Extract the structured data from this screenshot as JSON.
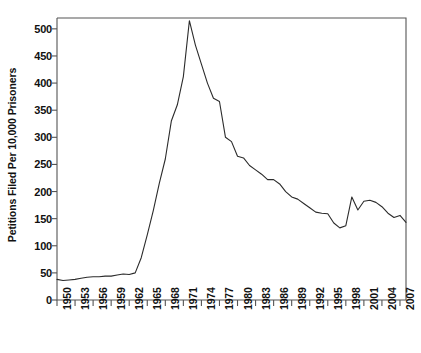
{
  "chart_data": {
    "type": "line",
    "title": "",
    "xlabel": "",
    "ylabel": "Petitions Filed Per 10,000 Prisoners",
    "xlim": [
      1950,
      2008
    ],
    "ylim": [
      0,
      520
    ],
    "grid": false,
    "legend": "none",
    "line_color": "#2b2b2b",
    "axis_color": "#555555",
    "ytick_values": [
      0,
      50,
      100,
      150,
      200,
      250,
      300,
      350,
      400,
      450,
      500
    ],
    "ytick_labels": [
      "0",
      "50",
      "100",
      "150",
      "200",
      "250",
      "300",
      "350",
      "400",
      "450",
      "500"
    ],
    "xtick_values": [
      1950,
      1953,
      1956,
      1959,
      1962,
      1965,
      1968,
      1971,
      1974,
      1977,
      1980,
      1983,
      1986,
      1989,
      1992,
      1995,
      1998,
      2001,
      2004,
      2007
    ],
    "xtick_labels": [
      "1950",
      "1953",
      "1956",
      "1959",
      "1962",
      "1965",
      "1968",
      "1971",
      "1974",
      "1977",
      "1980",
      "1983",
      "1986",
      "1989",
      "1992",
      "1995",
      "1998",
      "2001",
      "2004",
      "2007"
    ],
    "x": [
      1950,
      1951,
      1952,
      1953,
      1954,
      1955,
      1956,
      1957,
      1958,
      1959,
      1960,
      1961,
      1962,
      1963,
      1964,
      1965,
      1966,
      1967,
      1968,
      1969,
      1970,
      1971,
      1972,
      1973,
      1974,
      1975,
      1976,
      1977,
      1978,
      1979,
      1980,
      1981,
      1982,
      1983,
      1984,
      1985,
      1986,
      1987,
      1988,
      1989,
      1990,
      1991,
      1992,
      1993,
      1994,
      1995,
      1996,
      1997,
      1998,
      1999,
      2000,
      2001,
      2002,
      2003,
      2004,
      2005,
      2006,
      2007,
      2008
    ],
    "y": [
      38,
      36,
      37,
      38,
      40,
      42,
      43,
      43,
      44,
      44,
      46,
      48,
      47,
      50,
      78,
      120,
      165,
      215,
      260,
      330,
      360,
      412,
      515,
      470,
      435,
      400,
      372,
      366,
      300,
      292,
      265,
      262,
      248,
      240,
      232,
      222,
      222,
      214,
      200,
      190,
      186,
      178,
      170,
      162,
      160,
      159,
      142,
      133,
      137,
      190,
      166,
      182,
      184,
      180,
      172,
      160,
      152,
      156,
      143
    ],
    "peak": {
      "year": 1972,
      "value": 515
    },
    "minimum_recent": {
      "year": 1997,
      "value": 133
    }
  }
}
